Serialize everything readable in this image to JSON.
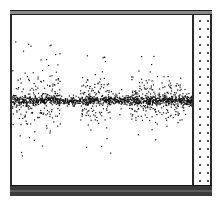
{
  "window": {
    "top_bar_color": "#8a8a8a",
    "frame_color": "#2a2a2a",
    "bottom_bar_color": "#3a3a3a"
  },
  "chart_data": {
    "type": "scatter",
    "title": "",
    "xlabel": "",
    "ylabel": "",
    "grid": false,
    "legend": false,
    "point_color": "#111111",
    "baseline_y": 100,
    "plot_box": {
      "x0": 12,
      "x1": 192,
      "y0": 15,
      "y1": 186
    },
    "clusters": [
      {
        "x_from": 12,
        "x_to": 60,
        "spread": 28,
        "count": 260,
        "outlier_spread": 60
      },
      {
        "x_from": 60,
        "x_to": 80,
        "spread": 4,
        "count": 60,
        "outlier_spread": 6
      },
      {
        "x_from": 80,
        "x_to": 110,
        "spread": 22,
        "count": 160,
        "outlier_spread": 60
      },
      {
        "x_from": 110,
        "x_to": 130,
        "spread": 6,
        "count": 70,
        "outlier_spread": 18
      },
      {
        "x_from": 130,
        "x_to": 185,
        "spread": 20,
        "count": 300,
        "outlier_spread": 45
      },
      {
        "x_from": 185,
        "x_to": 192,
        "spread": 5,
        "count": 40,
        "outlier_spread": 8
      }
    ]
  }
}
